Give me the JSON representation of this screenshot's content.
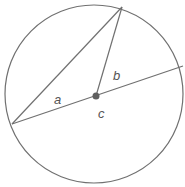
{
  "diagram": {
    "type": "circle-geometry",
    "colors": {
      "stroke": "#707070",
      "center_dot": "#606060",
      "label": "#555555",
      "background": "#ffffff"
    },
    "circle": {
      "cx": 94,
      "cy": 94,
      "r": 89
    },
    "points": {
      "left": {
        "x": 12,
        "y": 124
      },
      "top": {
        "x": 122,
        "y": 7
      },
      "right": {
        "x": 183,
        "y": 66
      },
      "center": {
        "x": 96,
        "y": 96
      }
    },
    "labels": {
      "a": "a",
      "b": "b",
      "c": "c"
    }
  }
}
